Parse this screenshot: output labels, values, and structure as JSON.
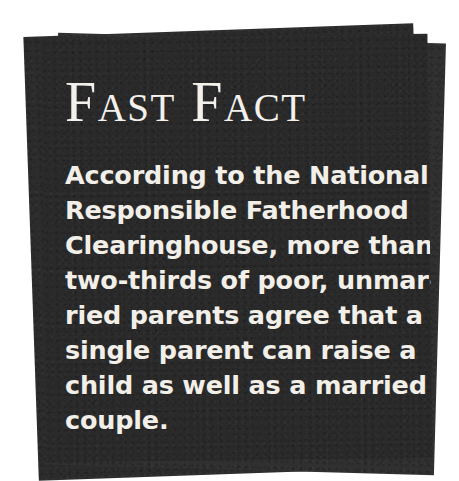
{
  "callout": {
    "kind": "fast-fact-callout",
    "headline": "Fast Fact",
    "body_lines": [
      "According to the National",
      "Responsible Fatherhood",
      "Clearinghouse, more than",
      "two-thirds of poor, unmar-",
      "ried parents agree that a",
      "single parent can raise a",
      "child as well as a married",
      "couple."
    ],
    "body_text": "According to the National Responsible Fatherhood Clearinghouse, more than two-thirds of poor, unmarried parents agree that a single parent can raise a child as well as a married couple.",
    "colors": {
      "page_background": "#ffffff",
      "card_front": "#2b2b2b",
      "card_mid": "#303030",
      "card_back": "#2c2c2c",
      "text": "#f2efe9"
    }
  }
}
